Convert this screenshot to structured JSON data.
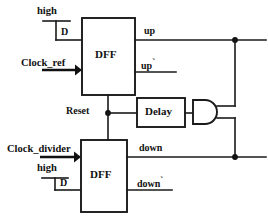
{
  "diagram": {
    "type": "digital-logic-schematic",
    "line_color": "#1a1a1a",
    "background_color": "#ffffff",
    "blocks": [
      {
        "id": "dff_top",
        "label": "DFF",
        "x": 82,
        "y": 18,
        "w": 53,
        "h": 77
      },
      {
        "id": "dff_bottom",
        "label": "DFF",
        "x": 81,
        "y": 140,
        "w": 46,
        "h": 72
      },
      {
        "id": "delay",
        "label": "Delay",
        "x": 137,
        "y": 98,
        "w": 48,
        "h": 29
      },
      {
        "id": "and_gate",
        "label": "AND",
        "x": 193,
        "y": 100,
        "w": 24,
        "h": 24
      }
    ],
    "inputs": [
      {
        "id": "high_top",
        "label": "high",
        "kind": "supply-rail"
      },
      {
        "id": "clock_ref",
        "label": "Clock_ref",
        "kind": "arrow-input"
      },
      {
        "id": "clock_divider",
        "label": "Clock_divider",
        "kind": "arrow-input"
      },
      {
        "id": "high_bottom",
        "label": "high",
        "kind": "supply-rail"
      }
    ],
    "pins": [
      {
        "id": "d_top",
        "label": "D",
        "block": "dff_top",
        "side": "left"
      },
      {
        "id": "d_bottom",
        "label": "D",
        "block": "dff_bottom",
        "side": "left"
      },
      {
        "id": "reset",
        "label": "Reset",
        "kind": "net"
      }
    ],
    "outputs": [
      {
        "id": "up",
        "label": "up",
        "tick": "",
        "block": "dff_top"
      },
      {
        "id": "up_bar",
        "label": "up",
        "tick": "`",
        "block": "dff_top"
      },
      {
        "id": "down",
        "label": "down",
        "tick": "",
        "block": "dff_bottom"
      },
      {
        "id": "down_bar",
        "label": "down",
        "tick": "`",
        "block": "dff_bottom"
      }
    ],
    "junctions": [
      {
        "id": "junction-up-bus",
        "x": 235,
        "y": 40
      },
      {
        "id": "junction-reset-net",
        "x": 108,
        "y": 113
      },
      {
        "id": "junction-down-bus",
        "x": 235,
        "y": 157
      }
    ]
  }
}
